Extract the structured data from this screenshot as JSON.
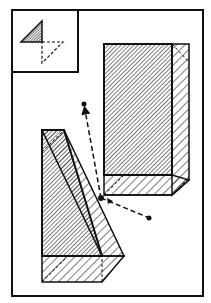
{
  "diagram": {
    "title": "",
    "colors": {
      "ink": "#111111",
      "background": "#ffffff"
    },
    "frame": {
      "x": 12,
      "y": 10,
      "w": 191,
      "h": 286
    },
    "inset": {
      "box": {
        "x": 12,
        "y": 10,
        "w": 66,
        "h": 62
      },
      "solid_triangle": "21,42 42,21 42,42",
      "dashed_triangle": "42,42 63,42 42,63"
    },
    "right_block": {
      "front_face": "104,44 172,44 172,175 104,175",
      "side_face": "172,44 189,44 189,180 172,195",
      "bottom_face": "104,175 172,175 189,180 172,195 104,195",
      "hidden_lines": [
        "172,44 189,62",
        "104,195 122,175",
        "172,195 189,178"
      ]
    },
    "left_block": {
      "front_face": "42,130 42,256 102,256 64,130",
      "slanted_face": "42,130 64,130 124,256 102,256",
      "bottom_face": "42,256 124,256 102,297 42,297",
      "hidden_lines": [
        "42,150 64,130",
        "42,297 72,256",
        "102,297 102,256"
      ]
    },
    "arrows": [
      {
        "name": "arrow-up",
        "from": [
          101,
          198
        ],
        "to": [
          84,
          105
        ]
      },
      {
        "name": "arrow-right",
        "from": [
          101,
          198
        ],
        "to": [
          149,
          218
        ]
      }
    ],
    "origin_point": [
      101,
      198
    ]
  }
}
